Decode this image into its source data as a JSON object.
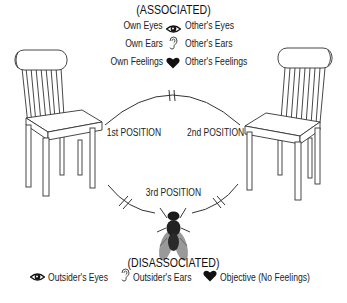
{
  "diagram": {
    "top_heading": "(ASSOCIATED)",
    "associated_rows": [
      {
        "left": "Own Eyes",
        "icon": "eye-icon",
        "right": "Other's Eyes"
      },
      {
        "left": "Own Ears",
        "icon": "ear-icon",
        "right": "Other's Ears"
      },
      {
        "left": "Own Feelings",
        "icon": "heart-icon",
        "right": "Other's Feelings"
      }
    ],
    "positions": {
      "first": "1st POSITION",
      "second": "2nd POSITION",
      "third": "3rd POSITION"
    },
    "bottom_heading": "(DISASSOCIATED)",
    "disassociated_legend": [
      {
        "icon": "eye-icon",
        "label": "Outsider's Eyes"
      },
      {
        "icon": "ear-icon",
        "label": "Outsider's Ears"
      },
      {
        "icon": "heart-icon",
        "label": "Objective (No Feelings)"
      }
    ],
    "figures": {
      "left": "chair-icon",
      "right": "chair-icon",
      "bottom": "fly-icon"
    }
  }
}
